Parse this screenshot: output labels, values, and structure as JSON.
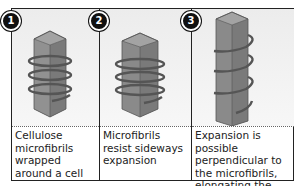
{
  "figure": {
    "panels": [
      {
        "number": "1",
        "caption": "Cellulose microfibrils wrapped around a cell",
        "illustration": "hexagonal-cell-with-helical-microfibrils-short"
      },
      {
        "number": "2",
        "caption": "Microfibrils resist sideways expansion",
        "illustration": "hexagonal-cell-with-helical-microfibrils-short"
      },
      {
        "number": "3",
        "caption": "Expansion is possible perpendicular to the microfibrils, elongating the cell",
        "illustration": "hexagonal-cell-with-helical-microfibrils-elongated"
      }
    ],
    "colors": {
      "cell_face_front": "#8a8a8a",
      "cell_face_side": "#6f6f6f",
      "cell_top": "#a3a3a3",
      "microfibril": "#555555",
      "badge": "#111111",
      "border": "#222222"
    }
  }
}
